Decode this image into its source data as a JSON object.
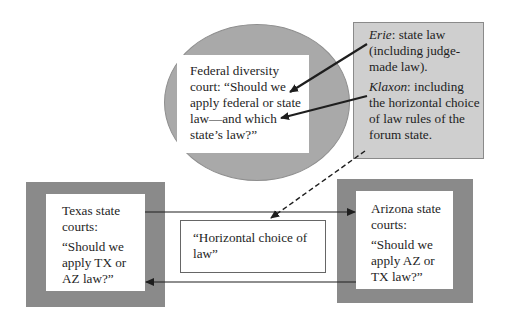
{
  "federal_court": {
    "text": "Federal diversity court: “Should we apply federal or state law—and which state’s law?”"
  },
  "rules_note": {
    "erie": {
      "case": "Erie",
      "text": ": state law (including judge-made law)."
    },
    "klaxon": {
      "case": "Klaxon",
      "text": ": including the horizontal choice of law rules of the forum state."
    }
  },
  "texas_court": {
    "title": "Texas state courts:",
    "question": "“Should we apply TX or AZ law?”"
  },
  "arizona_court": {
    "title": "Arizona state courts:",
    "question": "“Should we apply AZ or TX law?”"
  },
  "horizontal_choice": {
    "text": "“Horizontal choice of law”"
  },
  "colors": {
    "ellipse_fill": "#a9a9a9",
    "note_fill": "#cfcfcf",
    "court_frame": "#8a8a8a",
    "arrow": "#1e1e1e"
  }
}
